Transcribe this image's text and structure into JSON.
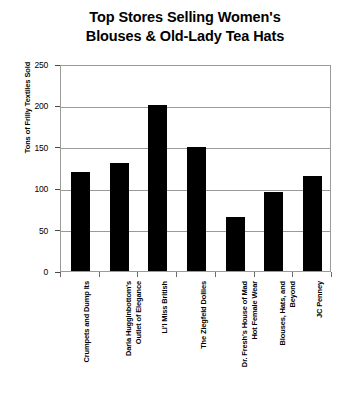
{
  "chart_data": {
    "type": "bar",
    "title": "Top Stores Selling Women's\nBlouses & Old-Lady Tea Hats",
    "title_line1": "Top Stores Selling Women's",
    "title_line2": "Blouses & Old-Lady Tea Hats",
    "xlabel": "",
    "ylabel": "Tons of Frilly Textiles Sold",
    "ylim": [
      0,
      250
    ],
    "ytick_step": 50,
    "ytick_labels": [
      "250",
      "200",
      "150",
      "100",
      "50",
      "0"
    ],
    "ytick_values": [
      250,
      200,
      150,
      100,
      50,
      0
    ],
    "grid": true,
    "legend": false,
    "bar_color": "#000000",
    "axis_color": "#9a9a9a",
    "categories": [
      "Crumpets and Dump Its",
      "Darla Hugginbottom's\nOutlet of Elegance",
      "Li'l Miss British",
      "The Ziegfeld Dollies",
      "Dr. Fresh's House of Mad\nHot Female Wear",
      "Blouses, Hats, and\nBeyond",
      "JC Penney"
    ],
    "values": [
      120,
      130,
      200,
      150,
      65,
      95,
      115
    ]
  }
}
